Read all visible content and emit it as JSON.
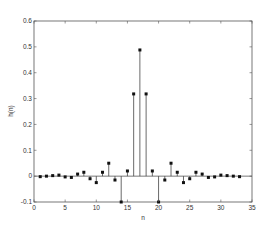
{
  "chart_data": {
    "type": "stem",
    "title": "",
    "xlabel": "n",
    "ylabel": "h(n)",
    "xlim": [
      0,
      35
    ],
    "ylim": [
      -0.1,
      0.6
    ],
    "grid": false,
    "legend": null,
    "x_ticks": [
      0,
      5,
      10,
      15,
      20,
      25,
      30,
      35
    ],
    "x_tick_labels": [
      "0",
      "5",
      "10",
      "15",
      "20",
      "25",
      "30",
      "35"
    ],
    "y_ticks": [
      -0.1,
      0,
      0.1,
      0.2,
      0.3,
      0.4,
      0.5,
      0.6
    ],
    "y_tick_labels": [
      "-0.1",
      "0",
      "0.1",
      "0.2",
      "0.3",
      "0.4",
      "0.5",
      "0.6"
    ],
    "x": [
      1,
      2,
      3,
      4,
      5,
      6,
      7,
      8,
      9,
      10,
      11,
      12,
      13,
      14,
      15,
      16,
      17,
      18,
      19,
      20,
      21,
      22,
      23,
      24,
      25,
      26,
      27,
      28,
      29,
      30,
      31,
      32,
      33
    ],
    "values": [
      -0.002,
      0.0,
      0.002,
      0.004,
      -0.003,
      -0.005,
      0.008,
      0.015,
      -0.01,
      -0.025,
      0.015,
      0.05,
      -0.015,
      -0.1,
      0.02,
      0.318,
      0.488,
      0.318,
      0.02,
      -0.1,
      -0.015,
      0.05,
      0.015,
      -0.025,
      -0.01,
      0.015,
      0.008,
      -0.005,
      -0.003,
      0.004,
      0.002,
      0.0,
      -0.002
    ],
    "colors": {
      "stem": "#444444",
      "marker": "#111111",
      "axis": "#555555",
      "baseline": "#555555"
    }
  }
}
